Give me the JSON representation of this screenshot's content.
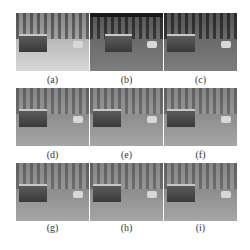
{
  "figure": {
    "panels": [
      {
        "label": "(a)",
        "style": "bright"
      },
      {
        "label": "(b)",
        "style": "dark"
      },
      {
        "label": "(c)",
        "style": "dark"
      },
      {
        "label": "(d)",
        "style": "hazy"
      },
      {
        "label": "(e)",
        "style": "hazy"
      },
      {
        "label": "(f)",
        "style": "hazy"
      },
      {
        "label": "(g)",
        "style": "hazy"
      },
      {
        "label": "(h)",
        "style": "hazy"
      },
      {
        "label": "(i)",
        "style": "hazy"
      }
    ]
  }
}
